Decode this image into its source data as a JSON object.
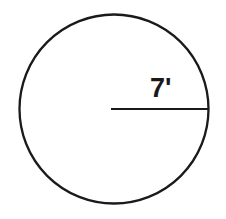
{
  "figure": {
    "name": "circle-with-radius",
    "background_color": "#ffffff",
    "stroke_color": "#1a1a1a",
    "text_color": "#191919",
    "canvas": {
      "width": 226,
      "height": 219
    },
    "circle": {
      "center_x": 114,
      "center_y": 109,
      "radius_px": 94.5,
      "stroke_width": 2.3,
      "fill": "none"
    },
    "radius_line": {
      "x1": 111,
      "y1": 109,
      "x2": 209,
      "y2": 109,
      "stroke_width": 2.2
    },
    "label": {
      "text": "7'",
      "value": 7,
      "unit": "feet",
      "unit_symbol": "'",
      "x": 150,
      "y": 97,
      "font_size": 27,
      "font_weight": "bold"
    }
  }
}
